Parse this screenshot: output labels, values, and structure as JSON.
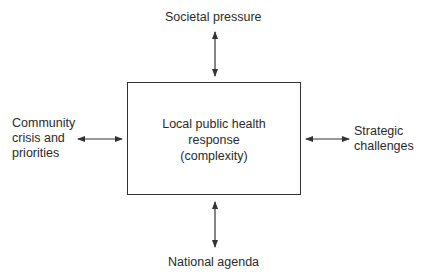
{
  "diagram": {
    "center": {
      "lines": [
        "Local public health",
        "response",
        "(complexity)"
      ]
    },
    "top": {
      "label": "Societal pressure"
    },
    "bottom": {
      "label": "National agenda"
    },
    "left": {
      "lines": [
        "Community",
        "crisis and",
        "priorities"
      ]
    },
    "right": {
      "lines": [
        "Strategic",
        "challenges"
      ]
    },
    "arrow_type": "bidirectional",
    "colors": {
      "line": "#333333",
      "text": "#2a2a2a",
      "background": "#ffffff"
    }
  }
}
